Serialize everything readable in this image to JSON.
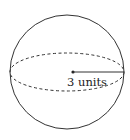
{
  "figure": {
    "type": "sphere",
    "radius_label": "3 units",
    "stroke_color": "#333333",
    "center": [
      73,
      72
    ],
    "radius_px": 57,
    "equator_ry_px": 20
  }
}
